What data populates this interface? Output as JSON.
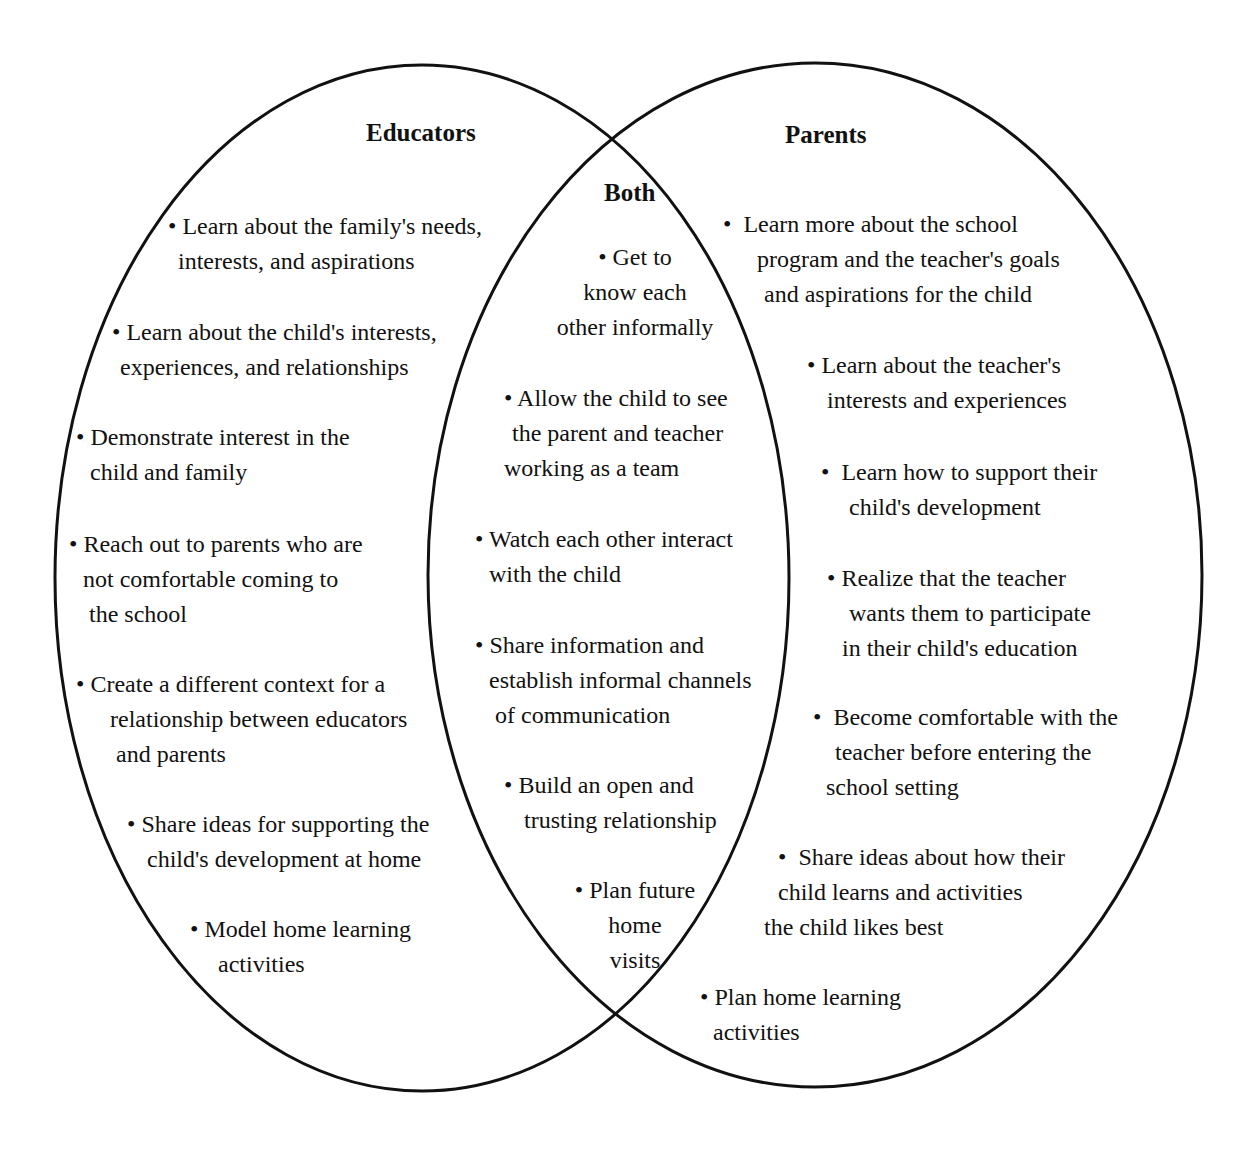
{
  "diagram": {
    "type": "venn",
    "sets": {
      "educators": {
        "title": "Educators",
        "items": [
          {
            "lines": [
              "• Learn about the family's needs,",
              "interests, and aspirations"
            ]
          },
          {
            "lines": [
              "• Learn about the child's interests,",
              "experiences, and relationships"
            ]
          },
          {
            "lines": [
              "• Demonstrate interest in the",
              "child and family"
            ]
          },
          {
            "lines": [
              "• Reach out to parents who are",
              "not comfortable coming to",
              " the school"
            ]
          },
          {
            "lines": [
              "• Create a different context for a",
              "relationship between educators",
              " and parents"
            ]
          },
          {
            "lines": [
              "• Share ideas for supporting the",
              "child's development at home"
            ]
          },
          {
            "lines": [
              "• Model home learning",
              "activities"
            ]
          }
        ]
      },
      "both": {
        "title": "Both",
        "items": [
          {
            "lines": [
              "• Get to",
              "know each",
              "other informally"
            ]
          },
          {
            "lines": [
              "• Allow the child to see",
              "the parent and teacher",
              "working as a team"
            ]
          },
          {
            "lines": [
              "• Watch each other interact",
              "with the child"
            ]
          },
          {
            "lines": [
              "• Share information and",
              "establish informal channels",
              "of communication"
            ]
          },
          {
            "lines": [
              "• Build an open and",
              "trusting relationship"
            ]
          },
          {
            "lines": [
              "• Plan future",
              "home",
              "visits"
            ]
          }
        ]
      },
      "parents": {
        "title": "Parents",
        "items": [
          {
            "lines": [
              "•  Learn more about the school",
              "program and the teacher's goals",
              "and aspirations for the child"
            ]
          },
          {
            "lines": [
              "• Learn about the teacher's",
              "interests and experiences"
            ]
          },
          {
            "lines": [
              "•  Learn how to support their",
              "child's development"
            ]
          },
          {
            "lines": [
              "• Realize that the teacher",
              "wants them to participate",
              "in their child's education"
            ]
          },
          {
            "lines": [
              "•  Become comfortable with the",
              "teacher before entering the",
              "school setting"
            ]
          },
          {
            "lines": [
              "•  Share ideas about how their",
              "child learns and activities",
              "the child likes best"
            ]
          },
          {
            "lines": [
              "• Plan home learning",
              "activities"
            ]
          }
        ]
      }
    },
    "colors": {
      "stroke": "#111111",
      "background": "#ffffff",
      "text": "#111111"
    }
  }
}
